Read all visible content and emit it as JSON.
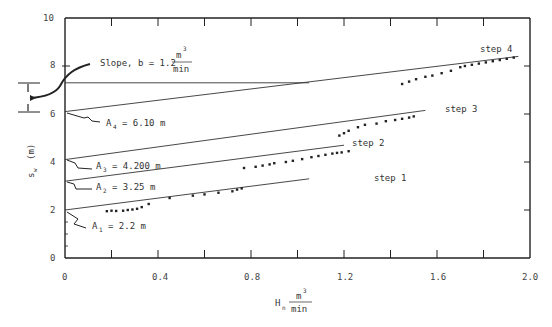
{
  "chart_data": {
    "type": "line",
    "title": "",
    "xlabel": "H_n (m^3/min)",
    "ylabel": "s_w (m)",
    "xlim": [
      0,
      2.0
    ],
    "ylim": [
      0,
      10
    ],
    "x_ticks": [
      "0",
      "0.4",
      "0.8",
      "1.2",
      "1.6",
      "2.0"
    ],
    "y_ticks": [
      "0",
      "2",
      "4",
      "6",
      "8",
      "10"
    ],
    "grid": false,
    "series": [
      {
        "name": "step 1",
        "line": {
          "x": [
            0,
            1.05
          ],
          "y": [
            2.0,
            3.3
          ]
        },
        "points": {
          "x": [
            0.18,
            0.2,
            0.22,
            0.25,
            0.27,
            0.29,
            0.31,
            0.33,
            0.36,
            0.45,
            0.55,
            0.6,
            0.66,
            0.72,
            0.74,
            0.76
          ],
          "y": [
            1.95,
            1.97,
            1.96,
            1.97,
            2.0,
            2.02,
            2.05,
            2.12,
            2.25,
            2.5,
            2.6,
            2.65,
            2.72,
            2.78,
            2.85,
            2.9
          ]
        }
      },
      {
        "name": "step 2",
        "line": {
          "x": [
            0,
            1.2
          ],
          "y": [
            3.2,
            4.7
          ]
        },
        "points": {
          "x": [
            0.77,
            0.82,
            0.85,
            0.88,
            0.9,
            0.95,
            0.98,
            1.02,
            1.06,
            1.09,
            1.12,
            1.15,
            1.17,
            1.19,
            1.22
          ],
          "y": [
            3.75,
            3.8,
            3.85,
            3.9,
            3.95,
            4.0,
            4.05,
            4.12,
            4.2,
            4.25,
            4.3,
            4.35,
            4.38,
            4.4,
            4.45
          ]
        }
      },
      {
        "name": "step 3",
        "line": {
          "x": [
            0,
            1.55
          ],
          "y": [
            4.1,
            6.15
          ]
        },
        "points": {
          "x": [
            1.18,
            1.2,
            1.22,
            1.26,
            1.29,
            1.34,
            1.38,
            1.42,
            1.45,
            1.48,
            1.5
          ],
          "y": [
            5.1,
            5.2,
            5.3,
            5.45,
            5.55,
            5.6,
            5.7,
            5.75,
            5.8,
            5.85,
            5.9
          ]
        }
      },
      {
        "name": "step 4",
        "line": {
          "x": [
            0,
            1.95
          ],
          "y": [
            6.1,
            8.4
          ]
        },
        "points": {
          "x": [
            1.45,
            1.48,
            1.51,
            1.55,
            1.58,
            1.62,
            1.66,
            1.7,
            1.72,
            1.75,
            1.78,
            1.81,
            1.84,
            1.87,
            1.9,
            1.93
          ],
          "y": [
            7.25,
            7.35,
            7.45,
            7.55,
            7.6,
            7.7,
            7.8,
            7.95,
            8.0,
            8.05,
            8.1,
            8.15,
            8.2,
            8.25,
            8.3,
            8.35
          ]
        }
      }
    ],
    "reference_line": {
      "y": 7.3,
      "x": [
        0,
        1.05
      ]
    },
    "annotations": [
      {
        "text": "Slope, b = 1.2 m³/min",
        "main": "Slope, b = 1.2",
        "num": "m",
        "sup": "3",
        "den": "min"
      },
      {
        "text": "A4 = 6.10 m",
        "label": "A",
        "sub": "4",
        "value": "= 6.10 m"
      },
      {
        "text": "A3 = 4.200 m",
        "label": "A",
        "sub": "3",
        "value": "= 4.200 m"
      },
      {
        "text": "A2 = 3.25 m",
        "label": "A",
        "sub": "2",
        "value": "= 3.25 m"
      },
      {
        "text": "A1 = 2.2 m",
        "label": "A",
        "sub": "1",
        "value": "= 2.2 m"
      }
    ],
    "step_labels": [
      "step 1",
      "step 2",
      "step 3",
      "step 4"
    ],
    "axis_labels": {
      "x_main": "H",
      "x_sub": "n",
      "x_num": "m",
      "x_sup": "3",
      "x_den": "min",
      "y_main": "s",
      "y_sub": "w",
      "y_unit": "(m)"
    }
  }
}
